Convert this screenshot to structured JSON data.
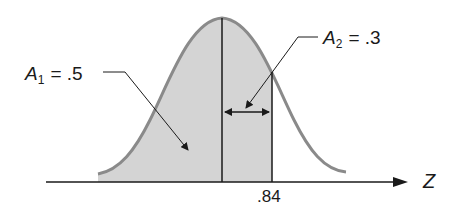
{
  "diagram": {
    "type": "normal-distribution-area",
    "labels": {
      "a1_var": "A",
      "a1_sub": "1",
      "a1_eq": "= .5",
      "a2_var": "A",
      "a2_sub": "2",
      "a2_eq": "= .3",
      "z_tick": ".84",
      "axis": "Z"
    },
    "regions": [
      {
        "name": "A1",
        "area": 0.5,
        "from": "-inf",
        "to": 0
      },
      {
        "name": "A2",
        "area": 0.3,
        "from": 0,
        "to": 0.84
      }
    ],
    "colors": {
      "fill": "#d4d4d4",
      "curve": "#8a8a8a",
      "lines": "#1a1a1a"
    }
  }
}
